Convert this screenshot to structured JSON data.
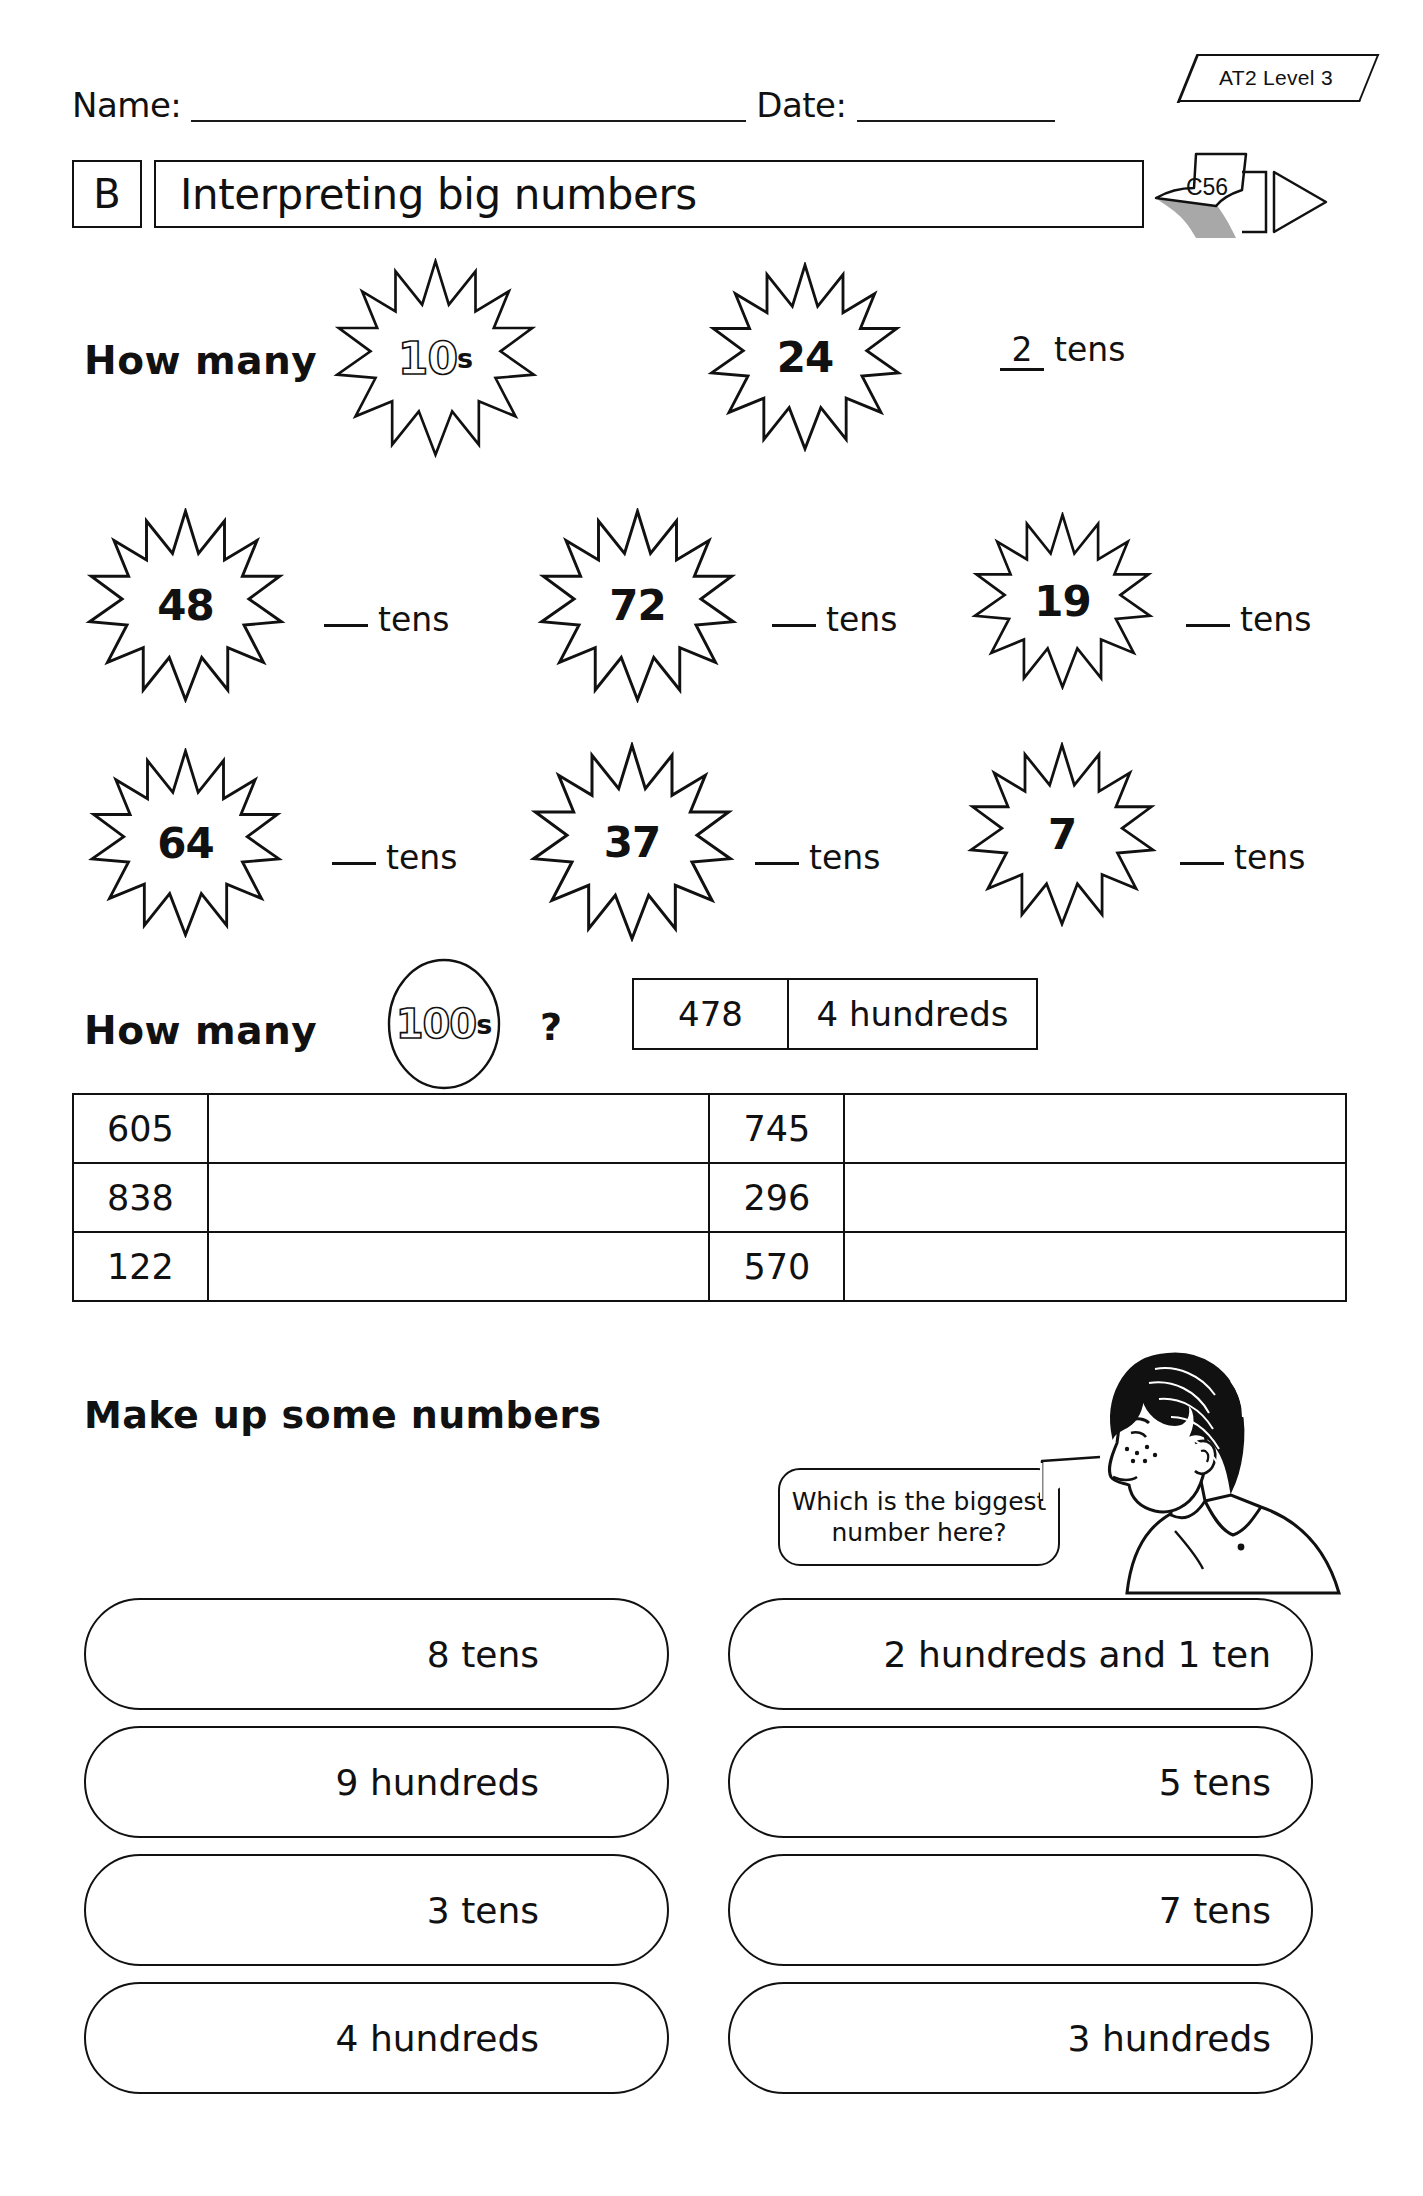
{
  "header": {
    "name_label": "Name:",
    "date_label": "Date:",
    "at_badge": "AT2 Level 3",
    "sheet_code": "C56",
    "section_letter": "B",
    "title": "Interpreting big numbers"
  },
  "tens_section": {
    "prompt": "How many",
    "unit_number": "10",
    "unit_suffix": "s",
    "example": {
      "star": "24",
      "answer": "2",
      "unit": "tens"
    },
    "questions": [
      {
        "star": "48",
        "answer": "",
        "unit": "tens"
      },
      {
        "star": "72",
        "answer": "",
        "unit": "tens"
      },
      {
        "star": "19",
        "answer": "",
        "unit": "tens"
      },
      {
        "star": "64",
        "answer": "",
        "unit": "tens"
      },
      {
        "star": "37",
        "answer": "",
        "unit": "tens"
      },
      {
        "star": "7",
        "answer": "",
        "unit": "tens"
      }
    ]
  },
  "hundreds_section": {
    "prompt": "How many",
    "unit_number": "100",
    "unit_suffix": "s",
    "question_mark": "?",
    "example": {
      "number": "478",
      "answer": "4 hundreds"
    },
    "table": {
      "rows": [
        {
          "left_number": "605",
          "left_answer": "",
          "right_number": "745",
          "right_answer": ""
        },
        {
          "left_number": "838",
          "left_answer": "",
          "right_number": "296",
          "right_answer": ""
        },
        {
          "left_number": "122",
          "left_answer": "",
          "right_number": "570",
          "right_answer": ""
        }
      ]
    }
  },
  "make_up": {
    "heading": "Make up some numbers",
    "speech_line1": "Which is the biggest",
    "speech_line2": "number here?",
    "pills_left": [
      "8 tens",
      "9 hundreds",
      "3 tens",
      "4 hundreds"
    ],
    "pills_right": [
      "2 hundreds and 1 ten",
      "5 tens",
      "7 tens",
      "3 hundreds"
    ]
  },
  "colors": {
    "ink": "#111111",
    "paper": "#ffffff",
    "pencil_body": "#a8a8a8"
  }
}
